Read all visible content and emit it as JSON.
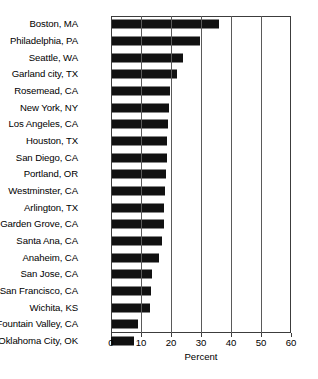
{
  "chart_data": {
    "type": "bar",
    "orientation": "horizontal",
    "title": "",
    "xlabel": "Percent",
    "ylabel": "",
    "xlim": [
      0,
      60
    ],
    "xticks": [
      0,
      10,
      20,
      30,
      40,
      50,
      60
    ],
    "grid": true,
    "legend": null,
    "bar_color": "#111111",
    "categories": [
      "Boston, MA",
      "Philadelphia, PA",
      "Seattle, WA",
      "Garland city, TX",
      "Rosemead, CA",
      "New York, NY",
      "Los Angeles, CA",
      "Houston, TX",
      "San Diego, CA",
      "Portland, OR",
      "Westminster, CA",
      "Arlington, TX",
      "Garden Grove, CA",
      "Santa Ana, CA",
      "Anaheim, CA",
      "San Jose, CA",
      "San Francisco, CA",
      "Wichita, KS",
      "Fountain Valley, CA",
      "Oklahoma City, OK"
    ],
    "values": [
      36.0,
      29.5,
      24.0,
      22.0,
      19.5,
      19.3,
      19.0,
      18.8,
      18.5,
      18.3,
      18.0,
      17.8,
      17.5,
      17.0,
      16.0,
      13.8,
      13.3,
      13.0,
      9.0,
      7.5
    ]
  }
}
